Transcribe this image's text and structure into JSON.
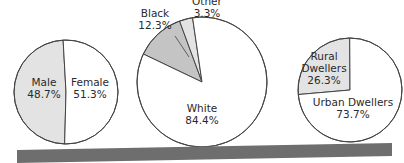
{
  "chart_data": [
    {
      "type": "pie",
      "title": "",
      "slices": [
        {
          "label": "Male",
          "value": 48.7,
          "value_label": "48.7%",
          "color": "#e3e3e3"
        },
        {
          "label": "Female",
          "value": 51.3,
          "value_label": "51.3%",
          "color": "#ffffff"
        }
      ]
    },
    {
      "type": "pie",
      "title": "",
      "slices": [
        {
          "label": "White",
          "value": 84.4,
          "value_label": "84.4%",
          "color": "#ffffff"
        },
        {
          "label": "Black",
          "value": 12.3,
          "value_label": "12.3%",
          "color": "#c4c4c4"
        },
        {
          "label": "Other",
          "value": 3.3,
          "value_label": "3.3%",
          "color": "#e3e3e3"
        }
      ]
    },
    {
      "type": "pie",
      "title": "",
      "slices": [
        {
          "label": "Rural Dwellers",
          "value": 26.3,
          "value_label": "26.3%",
          "color": "#e3e3e3"
        },
        {
          "label": "Urban Dwellers",
          "value": 73.7,
          "value_label": "73.7%",
          "color": "#ffffff"
        }
      ]
    }
  ],
  "colors": {
    "outline": "#444444",
    "bottom_bar": "#6e6e6e"
  }
}
